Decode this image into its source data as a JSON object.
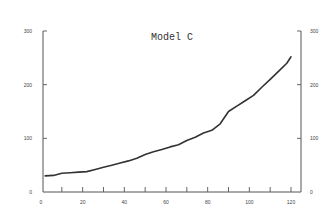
{
  "chart_data": {
    "type": "line",
    "title": "Model C",
    "xlabel": "",
    "ylabel": "",
    "xlim": [
      0,
      122
    ],
    "ylim": [
      0,
      300
    ],
    "x_ticks": [
      0,
      20,
      40,
      60,
      80,
      100,
      120
    ],
    "x_minor_ticks": [
      10,
      30,
      50,
      70,
      90,
      110
    ],
    "y_ticks_left": [
      0,
      100,
      200,
      300
    ],
    "y_ticks_right": [
      0,
      100,
      200,
      300
    ],
    "grid": false,
    "legend": "none",
    "series": [
      {
        "name": "Model C",
        "color": "#333333",
        "x": [
          2,
          6,
          10,
          14,
          18,
          22,
          26,
          30,
          34,
          38,
          42,
          46,
          50,
          54,
          58,
          62,
          66,
          70,
          74,
          78,
          82,
          86,
          90,
          94,
          98,
          102,
          106,
          110,
          114,
          118,
          120
        ],
        "y": [
          30,
          31,
          35,
          36,
          37,
          38,
          42,
          46,
          50,
          54,
          58,
          63,
          70,
          75,
          79,
          84,
          88,
          96,
          102,
          110,
          115,
          127,
          150,
          160,
          170,
          180,
          195,
          210,
          225,
          240,
          252
        ]
      }
    ]
  }
}
